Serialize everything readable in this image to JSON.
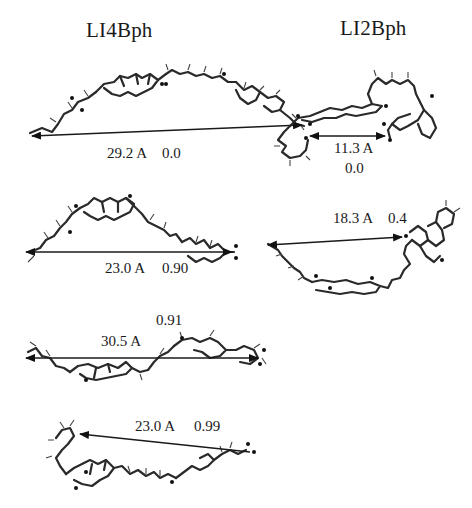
{
  "figure": {
    "columns": [
      {
        "title": "LI4Bph"
      },
      {
        "title": "LI2Bph"
      }
    ],
    "conformers": {
      "LI4Bph": [
        {
          "distance": "29.2 A",
          "value": "0.0"
        },
        {
          "distance": "23.0 A",
          "value": "0.90"
        },
        {
          "distance": "30.5 A",
          "value": "0.91"
        },
        {
          "distance": "23.0 A",
          "value": "0.99"
        }
      ],
      "LI2Bph": [
        {
          "distance": "11.3 A",
          "value": "0.0"
        },
        {
          "distance": "18.3 A",
          "value": "0.4"
        }
      ]
    }
  }
}
